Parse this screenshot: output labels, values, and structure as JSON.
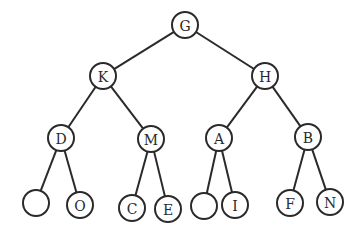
{
  "diagram": {
    "type": "binary-tree",
    "colors": {
      "stroke": "#2a2a2a",
      "fill": "#ffffff",
      "background": "#ffffff"
    },
    "node_radius": 13,
    "nodes": [
      {
        "id": "n0",
        "label": "G",
        "x": 185,
        "y": 25
      },
      {
        "id": "n1",
        "label": "K",
        "x": 103,
        "y": 76
      },
      {
        "id": "n2",
        "label": "H",
        "x": 265,
        "y": 76
      },
      {
        "id": "n3",
        "label": "D",
        "x": 61,
        "y": 138
      },
      {
        "id": "n4",
        "label": "M",
        "x": 151,
        "y": 139
      },
      {
        "id": "n5",
        "label": "A",
        "x": 219,
        "y": 138
      },
      {
        "id": "n6",
        "label": "B",
        "x": 308,
        "y": 137
      },
      {
        "id": "n7",
        "label": "",
        "x": 36,
        "y": 203
      },
      {
        "id": "n8",
        "label": "O",
        "x": 80,
        "y": 205
      },
      {
        "id": "n9",
        "label": "C",
        "x": 132,
        "y": 208
      },
      {
        "id": "n10",
        "label": "E",
        "x": 168,
        "y": 209
      },
      {
        "id": "n11",
        "label": "",
        "x": 204,
        "y": 206
      },
      {
        "id": "n12",
        "label": "I",
        "x": 235,
        "y": 205
      },
      {
        "id": "n13",
        "label": "F",
        "x": 290,
        "y": 203
      },
      {
        "id": "n14",
        "label": "N",
        "x": 330,
        "y": 202
      }
    ],
    "edges": [
      [
        "n0",
        "n1"
      ],
      [
        "n0",
        "n2"
      ],
      [
        "n1",
        "n3"
      ],
      [
        "n1",
        "n4"
      ],
      [
        "n2",
        "n5"
      ],
      [
        "n2",
        "n6"
      ],
      [
        "n3",
        "n7"
      ],
      [
        "n3",
        "n8"
      ],
      [
        "n4",
        "n9"
      ],
      [
        "n4",
        "n10"
      ],
      [
        "n5",
        "n11"
      ],
      [
        "n5",
        "n12"
      ],
      [
        "n6",
        "n13"
      ],
      [
        "n6",
        "n14"
      ]
    ]
  }
}
